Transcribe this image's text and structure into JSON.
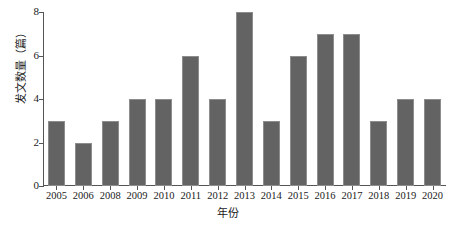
{
  "chart_data": {
    "type": "bar",
    "title": "",
    "xlabel": "年份",
    "ylabel": "发文数量（篇）",
    "categories": [
      "2005",
      "2006",
      "2008",
      "2009",
      "2010",
      "2011",
      "2012",
      "2013",
      "2014",
      "2015",
      "2016",
      "2017",
      "2018",
      "2019",
      "2020"
    ],
    "values": [
      3,
      2,
      3,
      4,
      4,
      6,
      4,
      8,
      3,
      6,
      7,
      7,
      3,
      4,
      4
    ],
    "ylim": [
      0,
      8
    ],
    "yticks": [
      "0",
      "2",
      "4",
      "6",
      "8"
    ],
    "ytick_values": [
      0,
      2,
      4,
      6,
      8
    ],
    "grid": false,
    "legend": null,
    "bar_color": "#636363",
    "axis_color": "#555555",
    "background": "#ffffff"
  }
}
